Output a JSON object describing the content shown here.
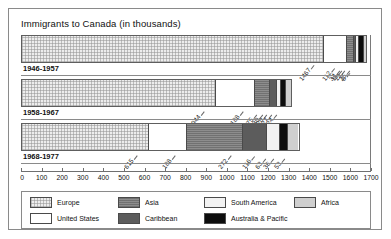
{
  "chart": {
    "title": "Immigrants to Canada (in thousands)"
  },
  "chart_data": {
    "type": "bar",
    "orientation": "horizontal",
    "stacked": true,
    "title": "Immigrants to Canada (in thousands)",
    "xlabel": "",
    "ylabel": "",
    "xlim": [
      0,
      1700
    ],
    "xticks": [
      0,
      100,
      200,
      300,
      400,
      500,
      600,
      700,
      800,
      900,
      1000,
      1100,
      1200,
      1300,
      1400,
      1500,
      1600,
      1700
    ],
    "xtick_labels": [
      "0",
      "100",
      "200",
      "300",
      "400",
      "500",
      "600",
      "700",
      "800",
      "900",
      "1000",
      "1100",
      "1200",
      "1300",
      "1400",
      "1500",
      "1600",
      "1700"
    ],
    "grid": false,
    "legend_position": "bottom",
    "categories": [
      "1946-1957",
      "1958-1967",
      "1968-1977"
    ],
    "series": [
      {
        "name": "Europe",
        "color": "#ededed",
        "values": [
          1467,
          944,
          615
        ]
      },
      {
        "name": "United States",
        "color": "#ffffff",
        "values": [
          112,
          188,
          188
        ]
      },
      {
        "name": "Asia",
        "color": "#8d8d8d",
        "values": [
          34,
          75,
          272
        ]
      },
      {
        "name": "Caribbean",
        "color": "#5c5c5c",
        "values": [
          11,
          30,
          116
        ]
      },
      {
        "name": "South America",
        "color": "#f2f2f2",
        "values": [
          12,
          20,
          63
        ]
      },
      {
        "name": "Australia & Pacific",
        "color": "#0d0d0d",
        "values": [
          25,
          27,
          36
        ]
      },
      {
        "name": "Africa",
        "color": "#cfcfcf",
        "values": [
          8,
          24,
          53
        ]
      }
    ]
  },
  "legend": {
    "entries": [
      {
        "label": "Europe"
      },
      {
        "label": "Asia"
      },
      {
        "label": "South America"
      },
      {
        "label": "Africa"
      },
      {
        "label": "United States"
      },
      {
        "label": "Caribbean"
      },
      {
        "label": "Australia & Pacific"
      }
    ]
  }
}
